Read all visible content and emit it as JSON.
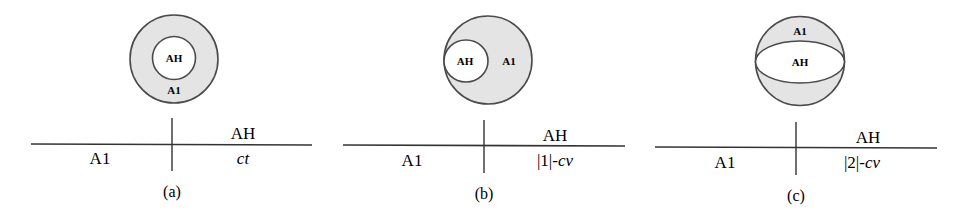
{
  "colors": {
    "region_fill": "#e4e4e4",
    "inner_fill": "#ffffff",
    "stroke": "#4a4a4a",
    "text": "#2a2a2a"
  },
  "panels": [
    {
      "id": "a",
      "caption": "(a)",
      "diagram": {
        "type": "concentric",
        "inner_label": "AH",
        "outer_label": "A1"
      },
      "table": {
        "left_label": "A1",
        "right_top": "AH",
        "right_bottom_plain": "",
        "right_bottom_italic": "ct"
      }
    },
    {
      "id": "b",
      "caption": "(b)",
      "diagram": {
        "type": "internally-tangent",
        "inner_label": "AH",
        "outer_label": "A1"
      },
      "table": {
        "left_label": "A1",
        "right_top": "AH",
        "right_bottom_plain": "|1|-",
        "right_bottom_italic": "cv"
      }
    },
    {
      "id": "c",
      "caption": "(c)",
      "diagram": {
        "type": "sphere-ellipse",
        "inner_label": "AH",
        "outer_label": "A1"
      },
      "table": {
        "left_label": "A1",
        "right_top": "AH",
        "right_bottom_plain": "|2|-",
        "right_bottom_italic": "cv"
      }
    }
  ]
}
